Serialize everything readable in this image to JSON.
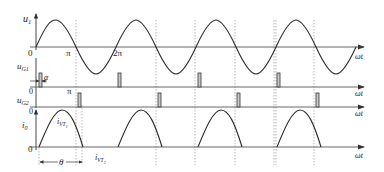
{
  "figure": {
    "colors": {
      "stroke": "#2a2a2a",
      "axis": "#555555",
      "grid": "#888888",
      "pulse_fill": "#c8c8c8"
    }
  },
  "panels": {
    "u1": {
      "ylabel": "u",
      "ysub": "1",
      "origin_label": "0",
      "tick_pi": "π",
      "tick_2pi": "2π",
      "xlabel": "ωt"
    },
    "ug1": {
      "ylabel": "u",
      "ysub": "G1",
      "alpha_label": "α",
      "xlabel": "ωt"
    },
    "ug2": {
      "ylabel": "u",
      "ysub": "G2",
      "origin_label": "0",
      "tick_pi": "π",
      "xlabel": "ωt"
    },
    "i0": {
      "ylabel": "i",
      "ysub": "0",
      "origin_top": "0",
      "origin_label": "0",
      "xlabel": "ωt",
      "vt1_label": "i",
      "vt1_sub": "VT",
      "vt1_subsub": "1",
      "vt2_label": "i",
      "vt2_sub": "VT",
      "vt2_subsub": "2",
      "theta_label": "θ"
    }
  }
}
